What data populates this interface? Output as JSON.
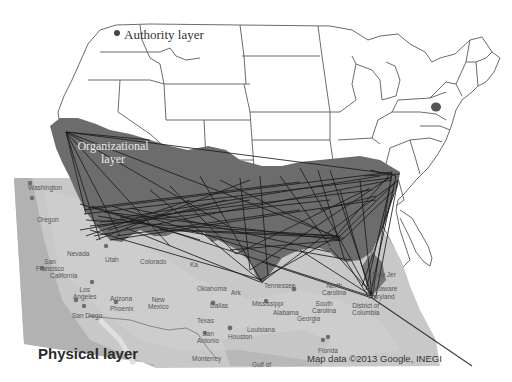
{
  "figure": {
    "layers": [
      {
        "id": "authority",
        "label": "Authority layer"
      },
      {
        "id": "organizational",
        "label": "Organizational layer",
        "label_lines": [
          "Organizational",
          "layer"
        ]
      },
      {
        "id": "physical",
        "label": "Physical layer"
      }
    ],
    "attribution": "Map data ©2013 Google, INEGI",
    "colors": {
      "background": "#ffffff",
      "state_outline": "#555555",
      "org_fill": "#6f6f6f",
      "physical_map": "#c9c9c9",
      "network_lines": "#1e1e1e",
      "highlight_state": "#555555"
    },
    "physical_map_labels": [
      {
        "text": "Washington",
        "x": 28,
        "y": 184
      },
      {
        "text": "Oregon",
        "x": 37,
        "y": 216
      },
      {
        "text": "Nevada",
        "x": 67,
        "y": 250
      },
      {
        "text": "Utah",
        "x": 105,
        "y": 256
      },
      {
        "text": "San\nFrancisco",
        "x": 36,
        "y": 258
      },
      {
        "text": "California",
        "x": 50,
        "y": 272
      },
      {
        "text": "Los\nAngeles",
        "x": 73,
        "y": 286
      },
      {
        "text": "San Diego",
        "x": 72,
        "y": 312
      },
      {
        "text": "Arizona",
        "x": 110,
        "y": 295
      },
      {
        "text": "Phoenix",
        "x": 110,
        "y": 305
      },
      {
        "text": "New\nMexico",
        "x": 148,
        "y": 296
      },
      {
        "text": "Colorado",
        "x": 140,
        "y": 258
      },
      {
        "text": "Ka",
        "x": 190,
        "y": 261
      },
      {
        "text": "Oklahoma",
        "x": 197,
        "y": 285
      },
      {
        "text": "Ark",
        "x": 231,
        "y": 289
      },
      {
        "text": "Dallas",
        "x": 210,
        "y": 302
      },
      {
        "text": "Texas",
        "x": 197,
        "y": 317
      },
      {
        "text": "San\nAntonio",
        "x": 197,
        "y": 330
      },
      {
        "text": "Houston",
        "x": 228,
        "y": 333
      },
      {
        "text": "Louisiana",
        "x": 247,
        "y": 326
      },
      {
        "text": "Monterrey",
        "x": 192,
        "y": 355
      },
      {
        "text": "Gulf of",
        "x": 252,
        "y": 361
      },
      {
        "text": "Tennessee",
        "x": 264,
        "y": 282
      },
      {
        "text": "Mississippi",
        "x": 252,
        "y": 300
      },
      {
        "text": "Alabama",
        "x": 273,
        "y": 309
      },
      {
        "text": "Georgia",
        "x": 297,
        "y": 315
      },
      {
        "text": "North\nCarolina",
        "x": 322,
        "y": 282
      },
      {
        "text": "South\nCarolina",
        "x": 312,
        "y": 300
      },
      {
        "text": "District of\nColumbia",
        "x": 352,
        "y": 302
      },
      {
        "text": "Delaware",
        "x": 370,
        "y": 285
      },
      {
        "text": "Maryland",
        "x": 368,
        "y": 293
      },
      {
        "text": "New Jer",
        "x": 372,
        "y": 271
      },
      {
        "text": "Florida",
        "x": 318,
        "y": 347
      }
    ]
  }
}
